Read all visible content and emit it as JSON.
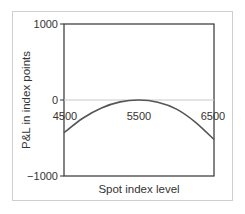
{
  "chart_data": {
    "type": "line",
    "title": "",
    "xlabel": "Spot index level",
    "ylabel": "P&L in index points",
    "x_ticks": [
      "4500",
      "5500",
      "6500"
    ],
    "y_ticks": [
      "1000",
      "0",
      "−1000"
    ],
    "xlim": [
      4500,
      6500
    ],
    "ylim": [
      -1000,
      1000
    ],
    "grid": false,
    "legend": null,
    "series": [
      {
        "name": "P&L",
        "x": [
          4500,
          4750,
          5000,
          5250,
          5500,
          5750,
          6000,
          6250,
          6500
        ],
        "y": [
          -430,
          -240,
          -105,
          -25,
          0,
          -30,
          -120,
          -290,
          -520
        ]
      }
    ],
    "colors": {
      "curve": "#555555",
      "zero_line": "#c8c8c8",
      "axes": "#333333",
      "frame": "#cfcfcf"
    }
  }
}
